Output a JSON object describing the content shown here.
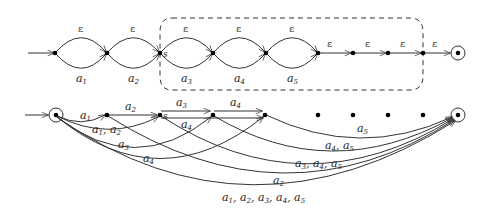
{
  "top_automaton": {
    "state_label_s": "s",
    "epsilon": "ε",
    "loops": [
      {
        "from": 55,
        "to": 107,
        "upper": "ε",
        "lower": "a",
        "lower_sub": "1"
      },
      {
        "from": 107,
        "to": 160,
        "upper": "ε",
        "lower": "a",
        "lower_sub": "2"
      },
      {
        "from": 160,
        "to": 213,
        "upper": "ε",
        "lower": "a",
        "lower_sub": "3"
      },
      {
        "from": 213,
        "to": 266,
        "upper": "ε",
        "lower": "a",
        "lower_sub": "4"
      },
      {
        "from": 266,
        "to": 318,
        "upper": "ε",
        "lower": "a",
        "lower_sub": "5"
      }
    ],
    "chain_epsilons": [
      "ε",
      "ε",
      "ε",
      "ε"
    ]
  },
  "bottom_automaton": {
    "state_label_s": "s",
    "edges": [
      {
        "id": "start-n1",
        "label": "a",
        "sub": "1"
      },
      {
        "id": "start-s",
        "label": "a",
        "sub": "1",
        "label2": "a",
        "sub2": "2"
      },
      {
        "id": "start-n3",
        "label": "a",
        "sub": "3"
      },
      {
        "id": "start-n4",
        "label": "a",
        "sub": "4"
      },
      {
        "id": "n1-s",
        "label": "a",
        "sub": "2"
      },
      {
        "id": "s-n3",
        "label": "a",
        "sub": "3"
      },
      {
        "id": "s-n4",
        "label": "a",
        "sub": "4"
      },
      {
        "id": "n3-n4",
        "label": "a",
        "sub": "4"
      },
      {
        "id": "n4-final",
        "text": "a5"
      },
      {
        "id": "n3-final",
        "text": "a4, a5"
      },
      {
        "id": "s-final",
        "text": "a3, a4, a5"
      },
      {
        "id": "n1-final",
        "text": "a2"
      },
      {
        "id": "start-final",
        "text": "a1, a2, a3, a4, a5"
      }
    ]
  }
}
